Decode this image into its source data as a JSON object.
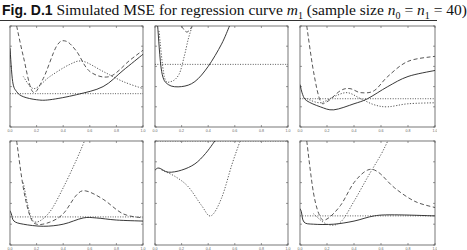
{
  "caption": {
    "label": "Fig. D.1",
    "text_pre": " Simulated MSE for regression curve ",
    "m_sym": "m",
    "m_sub": "1",
    "text_mid": " (sample size ",
    "n0": "n",
    "n0_sub": "0",
    "eq1": " = ",
    "n1": "n",
    "n1_sub": "1",
    "eq2": " = 40)"
  },
  "chart_data": [
    {
      "type": "line",
      "panel": "top-left",
      "xlim": [
        0,
        1
      ],
      "xticks": [
        "0.0",
        "0.2",
        "0.4",
        "0.6",
        "0.8",
        "1.0"
      ],
      "series": [
        {
          "name": "solid",
          "x": [
            0.0,
            0.02,
            0.05,
            0.1,
            0.2,
            0.3,
            0.5,
            0.7,
            0.85,
            1.0
          ],
          "y": [
            0.78,
            0.45,
            0.35,
            0.3,
            0.27,
            0.27,
            0.32,
            0.4,
            0.56,
            0.72
          ]
        },
        {
          "name": "dashed",
          "x": [
            0.05,
            0.1,
            0.17,
            0.25,
            0.35,
            0.42,
            0.5,
            0.6,
            0.75,
            0.9,
            1.0
          ],
          "y": [
            1.0,
            0.7,
            0.35,
            0.48,
            0.8,
            0.85,
            0.75,
            0.55,
            0.5,
            0.66,
            0.76
          ]
        },
        {
          "name": "dotted",
          "x": [
            0.1,
            0.18,
            0.3,
            0.45,
            0.55,
            0.7,
            0.85,
            1.0
          ],
          "y": [
            0.5,
            0.38,
            0.5,
            0.62,
            0.65,
            0.55,
            0.45,
            0.38
          ]
        },
        {
          "name": "flat-dotted",
          "x": [
            0.0,
            1.0
          ],
          "y": [
            0.33,
            0.33
          ]
        }
      ]
    },
    {
      "type": "line",
      "panel": "top-middle",
      "xlim": [
        0,
        1
      ],
      "xticks": [
        "0.0",
        "0.2",
        "0.4",
        "0.6",
        "0.8",
        "1.0"
      ],
      "series": [
        {
          "name": "solid",
          "x": [
            0.02,
            0.05,
            0.1,
            0.2,
            0.3,
            0.4,
            0.5,
            0.56
          ],
          "y": [
            1.0,
            0.55,
            0.42,
            0.4,
            0.45,
            0.6,
            0.82,
            1.0
          ]
        },
        {
          "name": "dotted",
          "x": [
            0.03,
            0.07,
            0.12,
            0.18,
            0.22,
            0.25,
            0.28
          ],
          "y": [
            0.95,
            0.5,
            0.45,
            0.52,
            0.7,
            0.87,
            1.0
          ]
        },
        {
          "name": "dashed",
          "x": [
            0.2,
            0.22,
            0.24,
            0.26,
            0.28
          ],
          "y": [
            1.0,
            0.96,
            0.94,
            0.96,
            1.0
          ]
        },
        {
          "name": "flat-dotted",
          "x": [
            0.0,
            1.0
          ],
          "y": [
            0.62,
            0.62
          ]
        }
      ]
    },
    {
      "type": "line",
      "panel": "top-right",
      "xlim": [
        0,
        1
      ],
      "xticks": [
        "0.0",
        "0.2",
        "0.4",
        "0.6",
        "0.8",
        "1.0"
      ],
      "series": [
        {
          "name": "solid",
          "x": [
            0.0,
            0.02,
            0.05,
            0.15,
            0.25,
            0.4,
            0.5,
            0.65,
            0.8,
            1.0
          ],
          "y": [
            0.42,
            0.32,
            0.26,
            0.2,
            0.17,
            0.23,
            0.28,
            0.4,
            0.5,
            0.56
          ]
        },
        {
          "name": "dashed",
          "x": [
            0.05,
            0.1,
            0.15,
            0.2,
            0.3,
            0.37,
            0.45,
            0.55,
            0.65,
            0.8,
            1.0
          ],
          "y": [
            1.0,
            0.55,
            0.26,
            0.25,
            0.36,
            0.38,
            0.34,
            0.36,
            0.5,
            0.65,
            0.7
          ]
        },
        {
          "name": "dotted",
          "x": [
            0.05,
            0.15,
            0.25,
            0.35,
            0.45,
            0.55,
            0.65,
            0.8,
            1.0
          ],
          "y": [
            0.28,
            0.24,
            0.3,
            0.34,
            0.28,
            0.22,
            0.2,
            0.23,
            0.24
          ]
        },
        {
          "name": "flat-dotted",
          "x": [
            0.0,
            1.0
          ],
          "y": [
            0.28,
            0.28
          ]
        }
      ]
    },
    {
      "type": "line",
      "panel": "bottom-left",
      "xlim": [
        0,
        1
      ],
      "xticks": [
        "0.0",
        "0.2",
        "0.4",
        "0.6",
        "0.8",
        "1.0"
      ],
      "series": [
        {
          "name": "solid",
          "x": [
            0.0,
            0.01,
            0.03,
            0.1,
            0.25,
            0.4,
            0.55,
            0.65,
            0.8,
            1.0
          ],
          "y": [
            0.33,
            0.3,
            0.23,
            0.2,
            0.18,
            0.2,
            0.26,
            0.26,
            0.24,
            0.23
          ]
        },
        {
          "name": "dashed",
          "x": [
            0.05,
            0.1,
            0.15,
            0.2,
            0.3,
            0.4,
            0.5,
            0.57,
            0.7,
            0.85,
            1.0
          ],
          "y": [
            1.0,
            0.55,
            0.28,
            0.2,
            0.22,
            0.3,
            0.48,
            0.52,
            0.44,
            0.3,
            0.26
          ]
        },
        {
          "name": "dotted",
          "x": [
            0.1,
            0.15,
            0.2,
            0.3,
            0.4,
            0.5,
            0.56
          ],
          "y": [
            0.6,
            0.3,
            0.22,
            0.32,
            0.55,
            0.82,
            1.0
          ]
        },
        {
          "name": "flat-dotted",
          "x": [
            0.0,
            1.0
          ],
          "y": [
            0.27,
            0.27
          ]
        }
      ]
    },
    {
      "type": "line",
      "panel": "bottom-middle",
      "xlim": [
        0,
        1
      ],
      "xticks": [
        "0.0",
        "0.2",
        "0.4",
        "0.6",
        "0.8",
        "1.0"
      ],
      "series": [
        {
          "name": "solid",
          "x": [
            0.0,
            0.03,
            0.1,
            0.2,
            0.3,
            0.38,
            0.45
          ],
          "y": [
            0.72,
            0.74,
            0.7,
            0.72,
            0.78,
            0.88,
            1.0
          ]
        },
        {
          "name": "dotted",
          "x": [
            0.05,
            0.15,
            0.25,
            0.35,
            0.42,
            0.5,
            0.58,
            0.64
          ],
          "y": [
            0.72,
            0.66,
            0.56,
            0.38,
            0.28,
            0.45,
            0.78,
            1.0
          ]
        },
        {
          "name": "flat-dotted",
          "x": [
            0.0,
            1.0
          ],
          "y": [
            1.0,
            1.0
          ]
        }
      ]
    },
    {
      "type": "line",
      "panel": "bottom-right",
      "xlim": [
        0,
        1
      ],
      "xticks": [
        "0.0",
        "0.2",
        "0.4",
        "0.6",
        "0.8",
        "1.0"
      ],
      "series": [
        {
          "name": "solid",
          "x": [
            0.0,
            0.01,
            0.03,
            0.1,
            0.25,
            0.4,
            0.55,
            0.7,
            1.0
          ],
          "y": [
            0.35,
            0.32,
            0.22,
            0.2,
            0.2,
            0.23,
            0.28,
            0.29,
            0.28
          ]
        },
        {
          "name": "dashed",
          "x": [
            0.05,
            0.1,
            0.15,
            0.2,
            0.3,
            0.4,
            0.5,
            0.58,
            0.7,
            0.85,
            1.0
          ],
          "y": [
            1.0,
            0.5,
            0.27,
            0.25,
            0.38,
            0.6,
            0.72,
            0.7,
            0.55,
            0.42,
            0.36
          ]
        },
        {
          "name": "dotted",
          "x": [
            0.1,
            0.2,
            0.3,
            0.4,
            0.5,
            0.6,
            0.65
          ],
          "y": [
            0.3,
            0.2,
            0.22,
            0.42,
            0.65,
            0.87,
            1.0
          ]
        },
        {
          "name": "flat-dotted",
          "x": [
            0.0,
            1.0
          ],
          "y": [
            0.28,
            0.28
          ]
        }
      ]
    }
  ]
}
